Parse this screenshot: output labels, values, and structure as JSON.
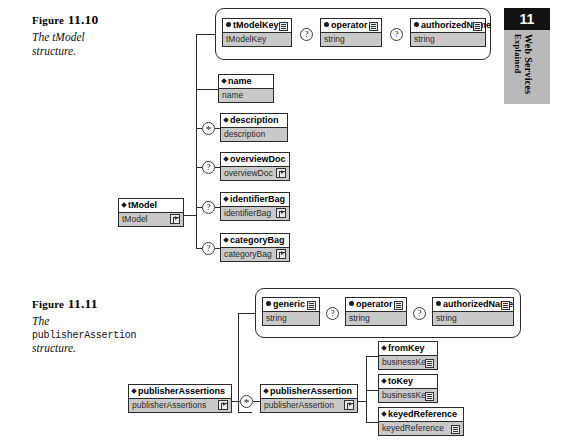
{
  "page": {
    "chapter_number": "11",
    "thumb_line1": "Web Services",
    "thumb_line2": "Explained"
  },
  "figures": [
    {
      "id": "fig-11-10",
      "number": "11.10",
      "label_prefix": "Figure",
      "caption_lines": [
        {
          "text": "The tModel",
          "style": "italic"
        },
        {
          "text": "structure.",
          "style": "italic"
        }
      ],
      "root": {
        "name": "tModel",
        "type": "tModel",
        "icon": "expand-icon",
        "marker": "diamond"
      },
      "attribute_group": [
        {
          "name": "tModelKey",
          "type": "tModelKey",
          "marker": "dot",
          "occurrence": "",
          "icon": "lines-icon"
        },
        {
          "name": "operator",
          "type": "string",
          "marker": "dot",
          "occurrence": "?",
          "icon": "lines-icon"
        },
        {
          "name": "authorizedName",
          "type": "string",
          "marker": "dot",
          "occurrence": "?",
          "icon": "lines-icon"
        }
      ],
      "elements": [
        {
          "name": "name",
          "type": "name",
          "marker": "diamond",
          "occurrence": "",
          "icon": ""
        },
        {
          "name": "description",
          "type": "description",
          "marker": "diamond",
          "occurrence": "*",
          "icon": ""
        },
        {
          "name": "overviewDoc",
          "type": "overviewDoc",
          "marker": "diamond",
          "occurrence": "?",
          "icon": "expand-icon"
        },
        {
          "name": "identifierBag",
          "type": "identifierBag",
          "marker": "diamond",
          "occurrence": "?",
          "icon": "expand-icon"
        },
        {
          "name": "categoryBag",
          "type": "categoryBag",
          "marker": "diamond",
          "occurrence": "?",
          "icon": "expand-icon"
        }
      ]
    },
    {
      "id": "fig-11-11",
      "number": "11.11",
      "label_prefix": "Figure",
      "caption_lines": [
        {
          "text": "The",
          "style": "italic"
        },
        {
          "text": "publisherAssertion",
          "style": "mono"
        },
        {
          "text": "structure.",
          "style": "italic"
        }
      ],
      "root": {
        "name": "publisherAssertions",
        "type": "publisherAssertions",
        "icon": "expand-icon",
        "marker": "diamond"
      },
      "child": {
        "name": "publisherAssertion",
        "type": "publisherAssertion",
        "icon": "expand-icon",
        "marker": "diamond",
        "occurrence": "*"
      },
      "attribute_group": [
        {
          "name": "generic",
          "type": "string",
          "marker": "dot",
          "occurrence": "",
          "icon": "lines-icon"
        },
        {
          "name": "operator",
          "type": "string",
          "marker": "dot",
          "occurrence": "?",
          "icon": "lines-icon"
        },
        {
          "name": "authorizedName",
          "type": "string",
          "marker": "dot",
          "occurrence": "?",
          "icon": "lines-icon"
        }
      ],
      "elements": [
        {
          "name": "fromKey",
          "type": "businessKey",
          "marker": "diamond",
          "occurrence": "",
          "icon": "lines-icon"
        },
        {
          "name": "toKey",
          "type": "businessKey",
          "marker": "diamond",
          "occurrence": "",
          "icon": "lines-icon"
        },
        {
          "name": "keyedReference",
          "type": "keyedReference",
          "marker": "diamond",
          "occurrence": "",
          "icon": "lines-icon"
        }
      ]
    }
  ]
}
